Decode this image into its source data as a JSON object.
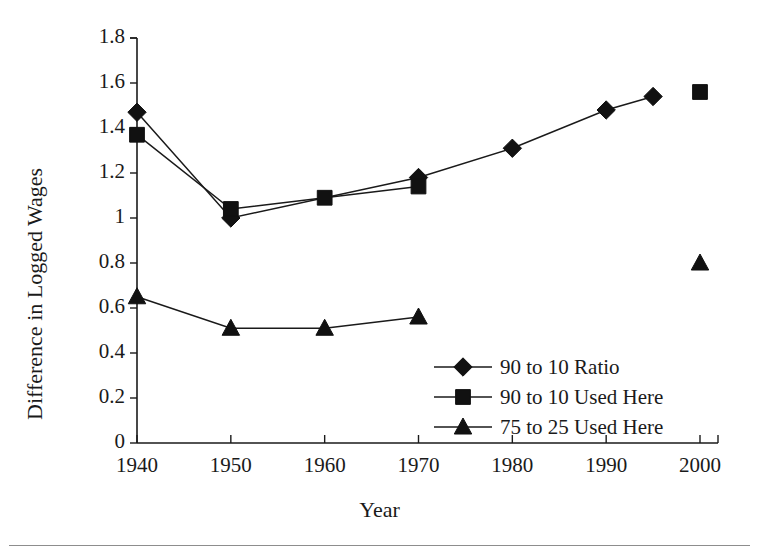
{
  "chart_data": {
    "type": "line",
    "title": "",
    "xlabel": "Year",
    "ylabel": "Difference in Logged Wages",
    "xlim": [
      1940,
      2000
    ],
    "ylim": [
      0,
      1.8
    ],
    "grid": false,
    "legend_position": "inside-lower-right",
    "x_tick_labels": [
      "1940",
      "1950",
      "1960",
      "1970",
      "1980",
      "1990",
      "2000"
    ],
    "x_ticks": [
      1940,
      1950,
      1960,
      1970,
      1980,
      1990,
      2000
    ],
    "y_tick_labels": [
      "0",
      "0.2",
      "0.4",
      "0.6",
      "0.8",
      "1",
      "1.2",
      "1.4",
      "1.6",
      "1.8"
    ],
    "y_ticks": [
      0,
      0.2,
      0.4,
      0.6,
      0.8,
      1,
      1.2,
      1.4,
      1.6,
      1.8
    ],
    "series": [
      {
        "name": "90 to 10 Ratio",
        "marker": "diamond",
        "x": [
          1940,
          1950,
          1970,
          1980,
          1990,
          1995
        ],
        "values": [
          1.47,
          1.0,
          1.18,
          1.31,
          1.48,
          1.54
        ]
      },
      {
        "name": "90 to 10 Used Here",
        "marker": "square",
        "x": [
          1940,
          1950,
          1960,
          1970
        ],
        "values": [
          1.37,
          1.04,
          1.09,
          1.14
        ],
        "isolated_points": [
          {
            "x": 2000,
            "y": 1.56
          }
        ]
      },
      {
        "name": "75 to 25 Used Here",
        "marker": "triangle",
        "x": [
          1940,
          1950,
          1960,
          1970
        ],
        "values": [
          0.65,
          0.51,
          0.51,
          0.56
        ],
        "isolated_points": [
          {
            "x": 2000,
            "y": 0.8
          }
        ]
      }
    ]
  },
  "legend": {
    "items": [
      {
        "label": "90 to 10 Ratio",
        "marker": "diamond"
      },
      {
        "label": "90 to 10 Used Here",
        "marker": "square"
      },
      {
        "label": "75 to 25 Used Here",
        "marker": "triangle"
      }
    ]
  },
  "axes": {
    "x_title": "Year",
    "y_title": "Difference in Logged Wages"
  },
  "colors": {
    "ink": "#111111",
    "background": "#ffffff",
    "rule": "#8d8d8d"
  }
}
